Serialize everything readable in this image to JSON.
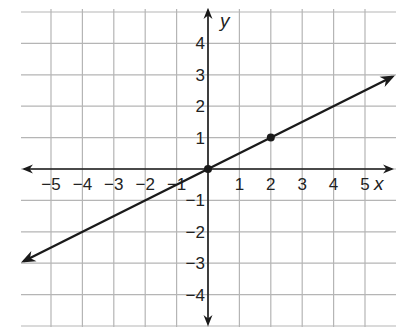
{
  "chart_data": {
    "type": "line",
    "title": "",
    "xlabel": "x",
    "ylabel": "y",
    "xlim": [
      -6,
      6
    ],
    "ylim": [
      -5,
      5
    ],
    "grid": true,
    "x_ticks": [
      -5,
      -4,
      -3,
      -2,
      -1,
      1,
      2,
      3,
      4,
      5
    ],
    "y_ticks": [
      4,
      3,
      2,
      1,
      -1,
      -2,
      -3,
      -4
    ],
    "x_tick_labels": [
      "−5",
      "−4",
      "−3",
      "−2",
      "−1",
      "1",
      "2",
      "3",
      "4",
      "5"
    ],
    "y_tick_labels": [
      "4",
      "3",
      "2",
      "1",
      "−1",
      "−2",
      "−3",
      "−4"
    ],
    "series": [
      {
        "name": "line",
        "equation": "y = 0.5x",
        "x": [
          -6,
          6
        ],
        "y": [
          -3,
          3
        ],
        "arrows": "both",
        "color": "#1a1a1a"
      }
    ],
    "points": [
      {
        "x": 0,
        "y": 0
      },
      {
        "x": 2,
        "y": 1
      }
    ]
  },
  "colors": {
    "grid": "#b5b5b5",
    "axis": "#1a1a1a",
    "line": "#1a1a1a"
  },
  "labels": {
    "x_axis": "x",
    "y_axis": "y"
  }
}
